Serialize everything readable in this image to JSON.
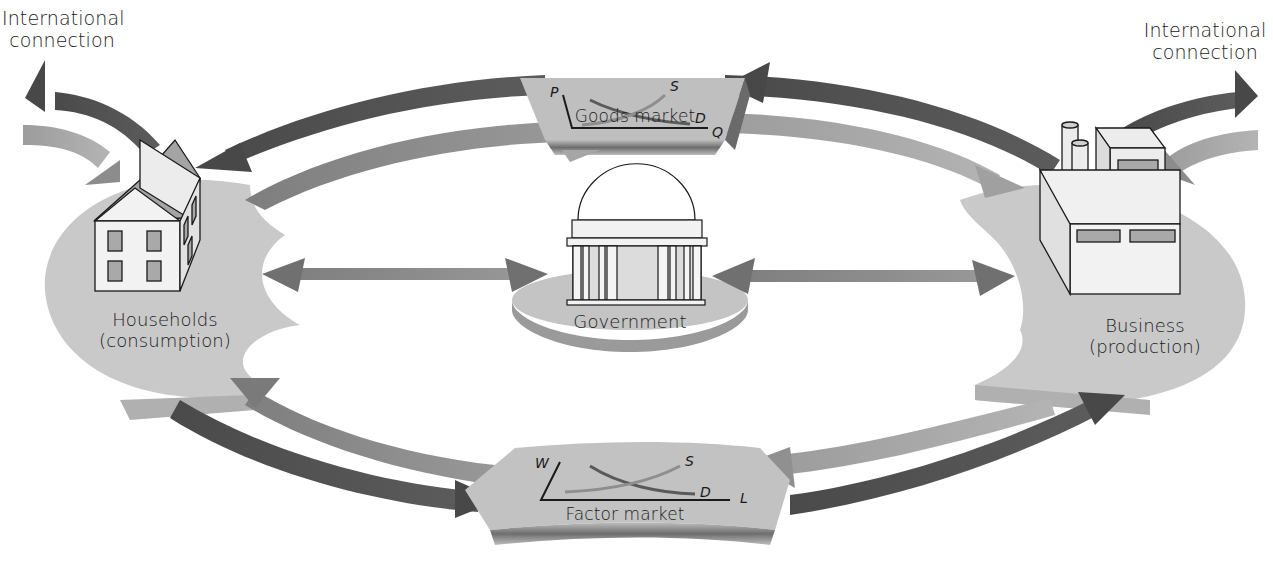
{
  "diagram": {
    "colors": {
      "platter": "#c9c9c9",
      "platter_edge": "#b2b2b2",
      "arrow_dark": "#505050",
      "arrow_medium": "#8a8a8a",
      "arrow_light": "#a8a8a8",
      "outline": "#1a1a1a",
      "window_fill": "#a9a9a9",
      "building_fill": "#eeeeee"
    },
    "international_left": {
      "line1": "International",
      "line2": "connection"
    },
    "international_right": {
      "line1": "International",
      "line2": "connection"
    },
    "households": {
      "line1": "Households",
      "line2": "(consumption)",
      "icon": "house-icon"
    },
    "business": {
      "line1": "Business",
      "line2": "(production)",
      "icon": "factory-icon"
    },
    "government": {
      "label": "Government",
      "icon": "capitol-building-icon"
    },
    "goods_market": {
      "label": "Goods market",
      "y_axis": "P",
      "x_axis": "Q",
      "supply": "S",
      "demand": "D"
    },
    "factor_market": {
      "label": "Factor market",
      "y_axis": "W",
      "x_axis": "L",
      "supply": "S",
      "demand": "D"
    },
    "flows": [
      {
        "from": "business",
        "to": "goods_market",
        "shade": "dark"
      },
      {
        "from": "goods_market",
        "to": "households",
        "shade": "dark"
      },
      {
        "from": "households",
        "to": "goods_market",
        "shade": "medium"
      },
      {
        "from": "goods_market",
        "to": "business",
        "shade": "light"
      },
      {
        "from": "households",
        "to": "factor_market",
        "shade": "dark"
      },
      {
        "from": "factor_market",
        "to": "business",
        "shade": "dark"
      },
      {
        "from": "business",
        "to": "factor_market",
        "shade": "light"
      },
      {
        "from": "factor_market",
        "to": "households",
        "shade": "medium"
      },
      {
        "from": "government",
        "to": "households",
        "shade": "medium",
        "bidirectional": true
      },
      {
        "from": "government",
        "to": "business",
        "shade": "medium",
        "bidirectional": true
      },
      {
        "from": "households",
        "to": "international",
        "shade": "dark"
      },
      {
        "from": "international",
        "to": "households",
        "shade": "light"
      },
      {
        "from": "business",
        "to": "international",
        "shade": "dark"
      },
      {
        "from": "international",
        "to": "business",
        "shade": "light"
      }
    ]
  }
}
